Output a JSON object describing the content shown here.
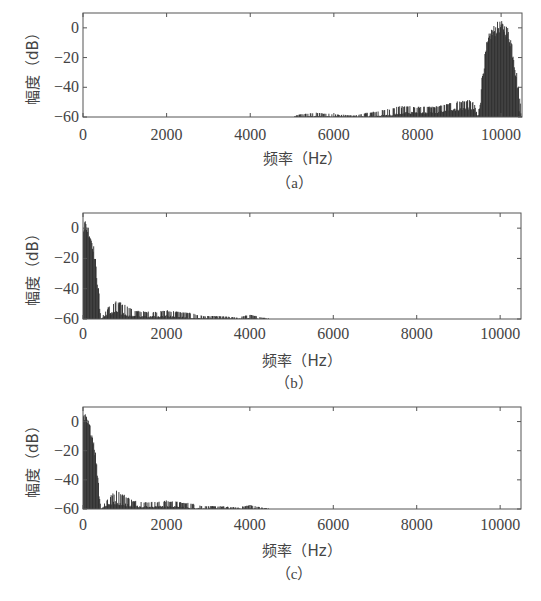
{
  "chart_data": [
    {
      "id": "a",
      "type": "line",
      "caption": "（a）",
      "title": "",
      "xlabel": "频率（Hz）",
      "ylabel": "幅度（dB）",
      "xlim": [
        0,
        10500
      ],
      "ylim": [
        -60,
        10
      ],
      "xticks": [
        0,
        2000,
        4000,
        6000,
        8000,
        10000
      ],
      "yticks": [
        0,
        -20,
        -40,
        -60
      ],
      "grid": false,
      "legend": null,
      "series": [
        {
          "name": "spectrum",
          "description": "Band-pass spectrum concentrated around 9500-10500 Hz with low-level noise spikes from ~5000 to 9400 Hz",
          "x": [
            0,
            5000,
            5200,
            5600,
            6000,
            6500,
            6800,
            7200,
            7500,
            7800,
            8000,
            8300,
            8600,
            8800,
            9000,
            9200,
            9350,
            9450,
            9550,
            9650,
            9750,
            9900,
            10000,
            10100,
            10200,
            10300,
            10400,
            10500
          ],
          "y_peak": [
            -60,
            -60,
            -58,
            -57,
            -58,
            -59,
            -57,
            -55,
            -53,
            -52,
            -53,
            -53,
            -52,
            -50,
            -49,
            -48,
            -50,
            -60,
            -30,
            -10,
            0,
            4,
            5,
            3,
            0,
            -12,
            -35,
            -60
          ],
          "y_floor": [
            -60,
            -60,
            -60,
            -60,
            -60,
            -60,
            -60,
            -60,
            -59,
            -58,
            -58,
            -58,
            -57,
            -56,
            -56,
            -55,
            -56,
            -60,
            -45,
            -30,
            -20,
            -15,
            -12,
            -15,
            -25,
            -40,
            -55,
            -60
          ]
        }
      ]
    },
    {
      "id": "b",
      "type": "line",
      "caption": "（b）",
      "title": "",
      "xlabel": "频率（Hz）",
      "ylabel": "幅度（dB）",
      "xlim": [
        0,
        10500
      ],
      "ylim": [
        -60,
        10
      ],
      "xticks": [
        0,
        2000,
        4000,
        6000,
        8000,
        10000
      ],
      "yticks": [
        0,
        -20,
        -40,
        -60
      ],
      "grid": false,
      "legend": null,
      "series": [
        {
          "name": "spectrum",
          "description": "Low-pass spectrum: ~0 to +5 dB near 0-200 Hz, falling to -60 dB by ~400 Hz, with decaying spikes (-48 to -60 dB) out to ~4500 Hz",
          "x": [
            0,
            50,
            100,
            150,
            200,
            250,
            300,
            350,
            400,
            420,
            600,
            800,
            1000,
            1200,
            1500,
            1800,
            2000,
            2300,
            2600,
            2900,
            3300,
            3700,
            4000,
            4300,
            4600,
            10500
          ],
          "y_peak": [
            8,
            6,
            4,
            0,
            -5,
            -10,
            -20,
            -35,
            -45,
            -60,
            -52,
            -48,
            -50,
            -54,
            -55,
            -55,
            -54,
            -55,
            -56,
            -58,
            -58,
            -59,
            -57,
            -59,
            -60,
            -60
          ],
          "y_floor": [
            -20,
            -10,
            -12,
            -15,
            -18,
            -25,
            -35,
            -45,
            -55,
            -60,
            -58,
            -57,
            -58,
            -59,
            -59,
            -59,
            -59,
            -59,
            -60,
            -60,
            -60,
            -60,
            -60,
            -60,
            -60,
            -60
          ]
        }
      ]
    },
    {
      "id": "c",
      "type": "line",
      "caption": "（c）",
      "title": "",
      "xlabel": "频率（Hz）",
      "ylabel": "幅度（dB）",
      "xlim": [
        0,
        10500
      ],
      "ylim": [
        -60,
        10
      ],
      "xticks": [
        0,
        2000,
        4000,
        6000,
        8000,
        10000
      ],
      "yticks": [
        0,
        -20,
        -40,
        -60
      ],
      "grid": false,
      "legend": null,
      "series": [
        {
          "name": "spectrum",
          "description": "Nearly identical to (b): low-pass spectrum with main lobe below ~400 Hz and decaying spikes out to ~4500 Hz",
          "x": [
            0,
            50,
            100,
            150,
            200,
            250,
            300,
            350,
            400,
            420,
            600,
            800,
            1000,
            1200,
            1500,
            1800,
            2000,
            2300,
            2600,
            2900,
            3300,
            3700,
            4000,
            4300,
            4600,
            10500
          ],
          "y_peak": [
            7,
            6,
            3,
            0,
            -5,
            -10,
            -20,
            -35,
            -45,
            -60,
            -52,
            -47,
            -50,
            -54,
            -55,
            -55,
            -54,
            -55,
            -56,
            -58,
            -58,
            -59,
            -57,
            -59,
            -60,
            -60
          ],
          "y_floor": [
            -20,
            -12,
            -12,
            -15,
            -18,
            -25,
            -35,
            -45,
            -55,
            -60,
            -58,
            -57,
            -58,
            -59,
            -59,
            -59,
            -59,
            -59,
            -60,
            -60,
            -60,
            -60,
            -60,
            -60,
            -60,
            -60
          ]
        }
      ]
    }
  ],
  "panels": {
    "a": {
      "xlabel": "频率（Hz）",
      "ylabel": "幅度（dB）",
      "caption": "（a）"
    },
    "b": {
      "xlabel": "频率（Hz）",
      "ylabel": "幅度（dB）",
      "caption": "（b）"
    },
    "c": {
      "xlabel": "频率（Hz）",
      "ylabel": "幅度（dB）",
      "caption": "（c）"
    }
  },
  "tick_labels": {
    "x": [
      "0",
      "2000",
      "4000",
      "6000",
      "8000",
      "10000"
    ],
    "y": [
      "0",
      "−20",
      "−40",
      "−60"
    ]
  },
  "colors": {
    "trace": "#2a2a2a",
    "axis": "#555555",
    "text": "#444444",
    "background": "#ffffff"
  }
}
